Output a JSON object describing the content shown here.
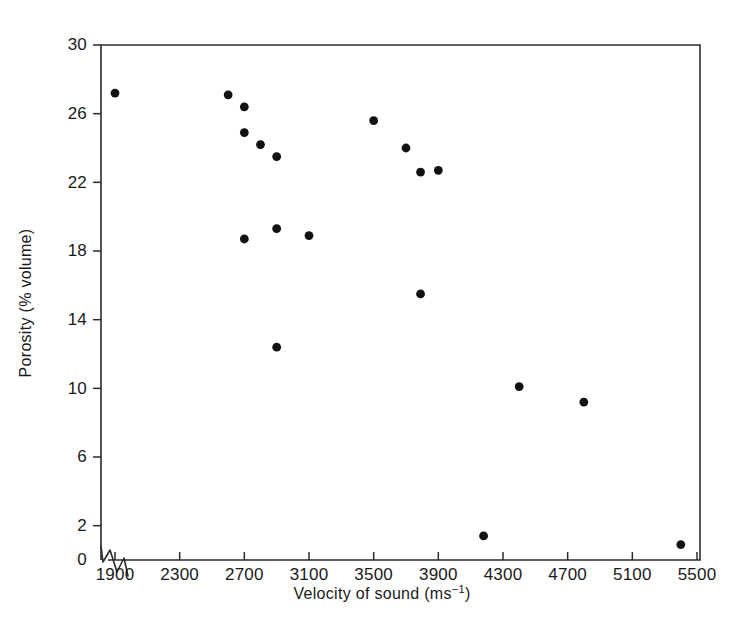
{
  "chart_data": {
    "type": "scatter",
    "title": "",
    "xlabel": "Velocity of sound (ms⁻¹)",
    "ylabel": "Porosity (% volume)",
    "xlim": [
      1700,
      5500
    ],
    "ylim": [
      0,
      30
    ],
    "grid": false,
    "legend": null,
    "axis_break": "zigzag break on x-axis at origin",
    "xticks": [
      1900,
      2300,
      2700,
      3100,
      3500,
      3900,
      4300,
      4700,
      5100,
      5500
    ],
    "xtick_labels": [
      "1900",
      "2300",
      "2700",
      "3100",
      "3500",
      "3900",
      "4300",
      "4700",
      "5100",
      "5500"
    ],
    "yticks": [
      0,
      2,
      6,
      10,
      14,
      18,
      22,
      26,
      30
    ],
    "ytick_labels": [
      "0",
      "2",
      "6",
      "10",
      "14",
      "18",
      "22",
      "26",
      "30"
    ],
    "marker": "filled-circle",
    "marker_color": "#111111",
    "points": [
      {
        "x": 1900,
        "y": 27.2
      },
      {
        "x": 2600,
        "y": 27.1
      },
      {
        "x": 2700,
        "y": 26.4
      },
      {
        "x": 2700,
        "y": 24.9
      },
      {
        "x": 2800,
        "y": 24.2
      },
      {
        "x": 2900,
        "y": 23.5
      },
      {
        "x": 2700,
        "y": 18.7
      },
      {
        "x": 2900,
        "y": 19.3
      },
      {
        "x": 3100,
        "y": 18.9
      },
      {
        "x": 3500,
        "y": 25.6
      },
      {
        "x": 3700,
        "y": 24.0
      },
      {
        "x": 3790,
        "y": 22.6
      },
      {
        "x": 3900,
        "y": 22.7
      },
      {
        "x": 3790,
        "y": 15.5
      },
      {
        "x": 2900,
        "y": 12.4
      },
      {
        "x": 4400,
        "y": 10.1
      },
      {
        "x": 4800,
        "y": 9.2
      },
      {
        "x": 4180,
        "y": 1.4
      },
      {
        "x": 5400,
        "y": 0.9
      }
    ]
  },
  "axis_labels": {
    "x_title_main": "Velocity of sound (ms",
    "x_title_sup": "−1",
    "x_title_tail": ")",
    "y_title": "Porosity (% volume)"
  },
  "colors": {
    "axis": "#2b2b2b",
    "text": "#1a1a1a",
    "marker": "#111111",
    "background": "#ffffff"
  }
}
